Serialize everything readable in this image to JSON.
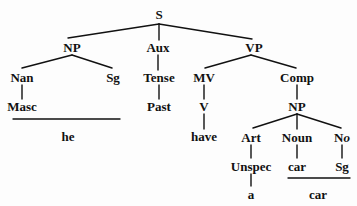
{
  "diagram": {
    "type": "syntax-tree",
    "nodes": {
      "s": "S",
      "np": "NP",
      "aux": "Aux",
      "vp": "VP",
      "nan": "Nan",
      "sg1": "Sg",
      "tense": "Tense",
      "mv": "MV",
      "comp": "Comp",
      "masc": "Masc",
      "past": "Past",
      "v": "V",
      "np2": "NP",
      "have": "have",
      "art": "Art",
      "noun": "Noun",
      "no_main": "N",
      "no_sub": "o",
      "unspec": "Unspec",
      "car1": "car",
      "sg2": "Sg",
      "he": "he",
      "a": "a",
      "car2": "car"
    },
    "line_color": "#111111",
    "text_color": "#111111"
  }
}
